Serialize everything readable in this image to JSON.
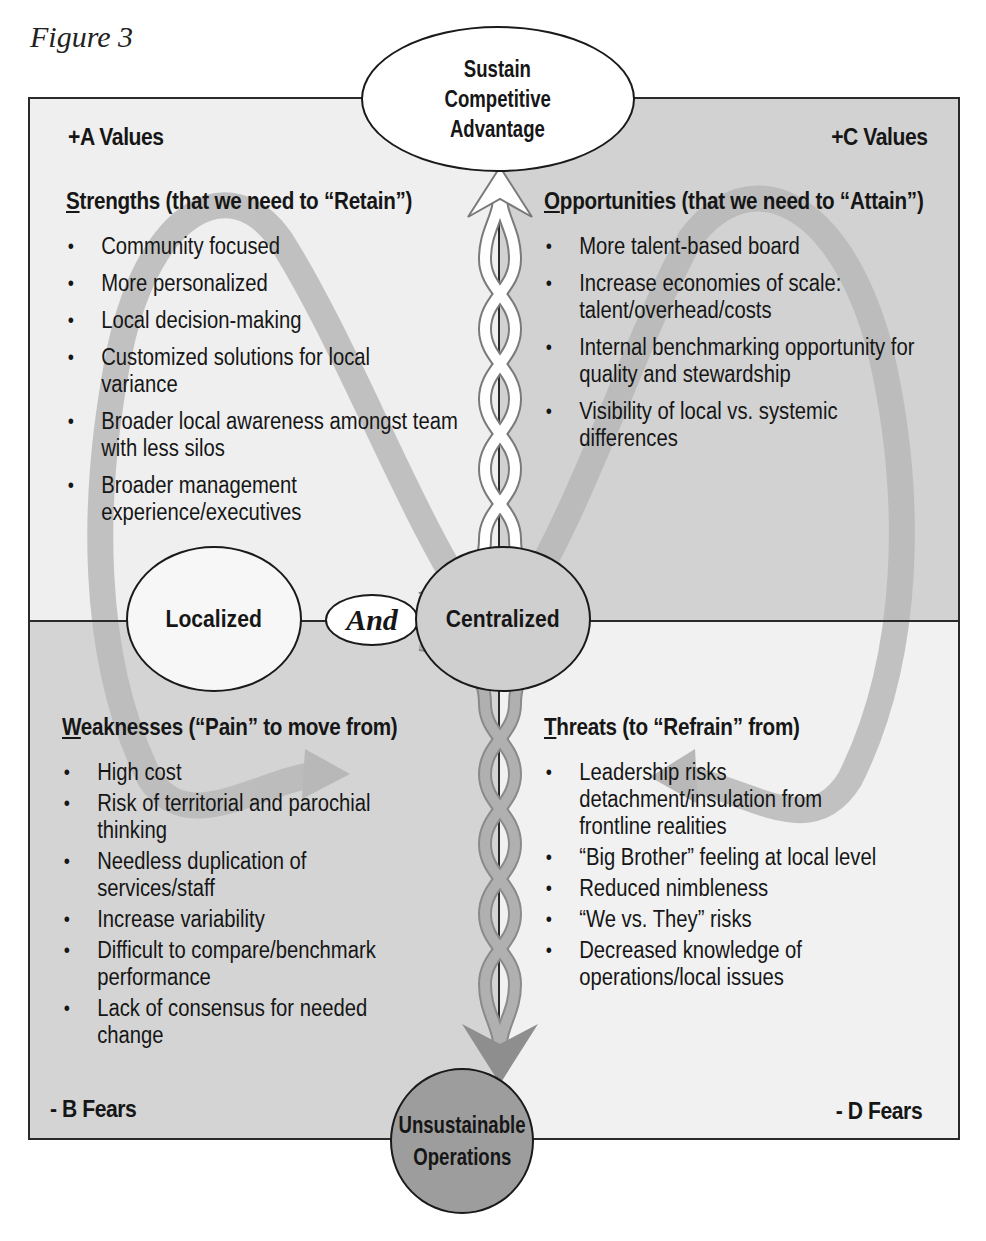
{
  "figure_label": "Figure 3",
  "nodes": {
    "top": "Sustain Competitive Advantage",
    "top_lines": [
      "Sustain",
      "Competitive",
      "Advantage"
    ],
    "left": "Localized",
    "center": "And",
    "right": "Centralized",
    "bottom": "Unsustainable Operations",
    "bottom_lines": [
      "Unsustainable",
      "Operations"
    ]
  },
  "corners": {
    "top_left": "+A Values",
    "top_right": "+C Values",
    "bottom_left": "- B Fears",
    "bottom_right": "- D Fears"
  },
  "quadrants": {
    "strengths": {
      "heading_initial": "S",
      "heading_rest": "trengths (that we need to “Retain”)",
      "items": [
        "Community focused",
        "More personalized",
        "Local decision-making",
        "Customized solutions for local variance",
        "Broader local awareness amongst team with less silos",
        "Broader management experience/executives"
      ]
    },
    "opportunities": {
      "heading_initial": "O",
      "heading_rest": "pportunities (that we need to “Attain”)",
      "items": [
        "More talent-based board",
        "Increase economies of scale: talent/overhead/costs",
        "Internal benchmarking opportunity for quality and stewardship",
        "Visibility of local vs. systemic differences"
      ]
    },
    "weaknesses": {
      "heading_initial": "W",
      "heading_rest": "eaknesses (“Pain” to move from)",
      "items": [
        "High cost",
        "Risk of territorial and parochial thinking",
        "Needless duplication of services/staff",
        "Increase variability",
        "Difficult to compare/benchmark performance",
        "Lack of consensus for needed change"
      ]
    },
    "threats": {
      "heading_initial": "T",
      "heading_rest": "hreats (to “Refrain” from)",
      "items": [
        "Leadership risks detachment/insulation from frontline realities",
        "“Big Brother” feeling at local level",
        "Reduced nimbleness",
        "“We vs. They” risks",
        "Decreased knowledge of operations/local issues"
      ]
    }
  },
  "colors": {
    "light_quadrant": "#efefef",
    "dark_quadrant": "#d2d2d2",
    "loop_arrow": "#b5b5b5",
    "bottom_node": "#9a9a9a",
    "outline": "#1a1a1a"
  }
}
